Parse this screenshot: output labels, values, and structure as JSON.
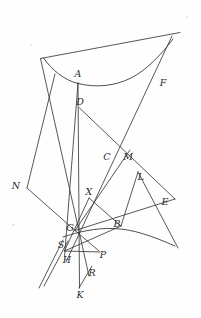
{
  "figure": {
    "kind": "geometry-diagram",
    "width": 201,
    "height": 318,
    "background_color": "#fefefe",
    "ink_color": "#3a3a3a",
    "label_color": "#2b2b2b",
    "labels": [
      {
        "text": "A",
        "x": 78,
        "y": 74
      },
      {
        "text": "D",
        "x": 80,
        "y": 102
      },
      {
        "text": "F",
        "x": 163,
        "y": 83
      },
      {
        "text": "C",
        "x": 107,
        "y": 157
      },
      {
        "text": "M",
        "x": 128,
        "y": 157
      },
      {
        "text": "N",
        "x": 16,
        "y": 186
      },
      {
        "text": "L",
        "x": 141,
        "y": 177
      },
      {
        "text": "X",
        "x": 89,
        "y": 192
      },
      {
        "text": "E",
        "x": 165,
        "y": 202
      },
      {
        "text": "G",
        "x": 70,
        "y": 228
      },
      {
        "text": "B",
        "x": 117,
        "y": 224
      },
      {
        "text": "S",
        "x": 61,
        "y": 245
      },
      {
        "text": "H",
        "x": 67,
        "y": 260
      },
      {
        "text": "P",
        "x": 103,
        "y": 255
      },
      {
        "text": "R",
        "x": 92,
        "y": 273
      },
      {
        "text": "K",
        "x": 80,
        "y": 295
      }
    ],
    "curves": [
      {
        "name": "hyperbola-left-branch",
        "path": "M 43.5 58 C 52 70, 64 80, 78 83.5 C 96 88, 115 86, 131 78 C 146 70.5, 162 54, 173 39"
      },
      {
        "name": "hyperbola-right-branch",
        "path": "M 63 237 C 78 232, 95 228, 113 228.5 C 133 229, 152 236, 175 246"
      }
    ],
    "segments": [
      {
        "name": "line-through-F-asymptote",
        "x1": 40.5,
        "y1": 58.5,
        "x2": 180,
        "y2": 32.5
      },
      {
        "name": "line-A-to-K-vertical",
        "x1": 78,
        "y1": 83,
        "x2": 79.5,
        "y2": 288
      },
      {
        "name": "line-A-to-H",
        "x1": 78,
        "y1": 83,
        "x2": 64.5,
        "y2": 257
      },
      {
        "name": "line-D-to-E",
        "x1": 79.5,
        "y1": 108,
        "x2": 175,
        "y2": 199
      },
      {
        "name": "line-top-left-to-R",
        "x1": 40.5,
        "y1": 58.5,
        "x2": 89,
        "y2": 276
      },
      {
        "name": "line-F-down-to-bottom",
        "x1": 172,
        "y1": 36,
        "x2": 66,
        "y2": 262
      },
      {
        "name": "line-N-up-to-A-side",
        "x1": 27,
        "y1": 188,
        "x2": 55,
        "y2": 74
      },
      {
        "name": "line-N-down-to-G",
        "x1": 27,
        "y1": 188,
        "x2": 75,
        "y2": 230.5
      },
      {
        "name": "line-G-to-M",
        "x1": 75,
        "y1": 230.5,
        "x2": 130,
        "y2": 150
      },
      {
        "name": "line-G-to-E",
        "x1": 75,
        "y1": 230.5,
        "x2": 175,
        "y2": 199
      },
      {
        "name": "line-G-to-P",
        "x1": 75,
        "y1": 230.5,
        "x2": 99,
        "y2": 251
      },
      {
        "name": "line-X-to-B",
        "x1": 89,
        "y1": 198,
        "x2": 121,
        "y2": 226
      },
      {
        "name": "line-X-to-H",
        "x1": 89,
        "y1": 198,
        "x2": 64.5,
        "y2": 251
      },
      {
        "name": "line-B-to-H",
        "x1": 121,
        "y1": 226,
        "x2": 64.5,
        "y2": 251
      },
      {
        "name": "line-B-to-L",
        "x1": 121,
        "y1": 226,
        "x2": 138,
        "y2": 172
      },
      {
        "name": "line-H-to-P-lower",
        "x1": 64.5,
        "y1": 251,
        "x2": 100,
        "y2": 252
      },
      {
        "name": "line-S-parallel-lower-left",
        "x1": 63,
        "y1": 240,
        "x2": 39,
        "y2": 288
      },
      {
        "name": "line-S-parallel-lower-left-2",
        "x1": 68,
        "y1": 241,
        "x2": 44,
        "y2": 286
      },
      {
        "name": "line-K-to-R-up",
        "x1": 79,
        "y1": 288,
        "x2": 92,
        "y2": 266
      },
      {
        "name": "line-L-to-E-down",
        "x1": 138,
        "y1": 172,
        "x2": 178,
        "y2": 248
      }
    ]
  }
}
